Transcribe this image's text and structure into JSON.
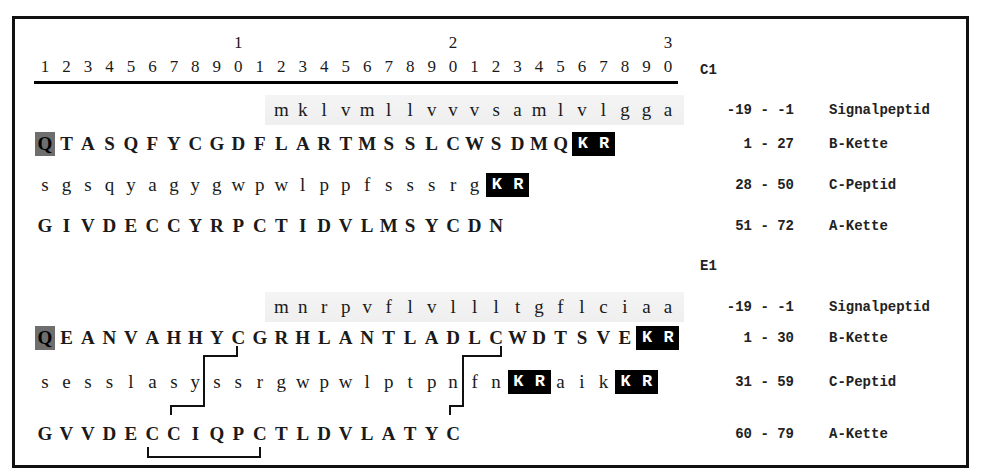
{
  "ruler": {
    "tens": [
      {
        "col": 10,
        "label": "1"
      },
      {
        "col": 20,
        "label": "2"
      },
      {
        "col": 30,
        "label": "3"
      }
    ],
    "units": [
      "1",
      "2",
      "3",
      "4",
      "5",
      "6",
      "7",
      "8",
      "9",
      "0",
      "1",
      "2",
      "3",
      "4",
      "5",
      "6",
      "7",
      "8",
      "9",
      "0",
      "1",
      "2",
      "3",
      "4",
      "5",
      "6",
      "7",
      "8",
      "9",
      "0"
    ]
  },
  "sections": [
    {
      "name": "C1",
      "rows": [
        {
          "type": "signal",
          "start_col": 12,
          "residues": "mklvmllvvvsamlvlgga",
          "range": "-19 - -1",
          "label": "Signalpeptid"
        },
        {
          "type": "B",
          "start_col": 1,
          "residues": "QTASQFYCGDFLARTMSSLCWSDMQKR",
          "range": "1 - 27",
          "label": "B-Kette",
          "highlight_first": true,
          "kr_positions": [
            26,
            27
          ]
        },
        {
          "type": "C",
          "start_col": 1,
          "residues": "sgsqyagygwpwlppfsssrgKR",
          "range": "28 - 50",
          "label": "C-Peptid",
          "kr_positions": [
            22,
            23
          ]
        },
        {
          "type": "A",
          "start_col": 1,
          "residues": "GIVDECCYRPCTIDVLMSYCDN",
          "range": "51 - 72",
          "label": "A-Kette"
        }
      ]
    },
    {
      "name": "E1",
      "rows": [
        {
          "type": "signal",
          "start_col": 12,
          "residues": "mnrpvflvllltgflciaa",
          "range": "-19 - -1",
          "label": "Signalpeptid"
        },
        {
          "type": "B",
          "start_col": 1,
          "residues": "QEANVAHHYCGRHLANTLADLCWDTSVEKR",
          "range": "1 - 30",
          "label": "B-Kette",
          "highlight_first": true,
          "kr_positions": [
            29,
            30
          ]
        },
        {
          "type": "C",
          "start_col": 1,
          "residues": "sesslasyssrgwpwlptpnfnKRaikKR",
          "range": "31 - 59",
          "label": "C-Peptid",
          "kr_positions": [
            23,
            24,
            28,
            29
          ]
        },
        {
          "type": "A",
          "start_col": 1,
          "residues": "GVVDECCIQPCTLDVLATYC",
          "range": "60 - 79",
          "label": "A-Kette"
        }
      ]
    }
  ],
  "disulfide_bridges": [
    {
      "from": "E1 B-Kette C10",
      "to": "E1 A-Kette C7"
    },
    {
      "from": "E1 B-Kette C22",
      "to": "E1 A-Kette C20"
    },
    {
      "from": "E1 A-Kette C6",
      "to": "E1 A-Kette C11"
    }
  ],
  "colors": {
    "kr_box": "#000000",
    "pyroglu_box": "#6e6e6e",
    "signal_shade": "#f0f0f0",
    "frame": "#111111"
  }
}
